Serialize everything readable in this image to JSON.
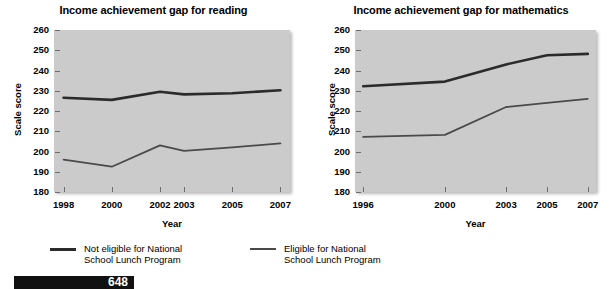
{
  "footer": {
    "page_number": "648"
  },
  "legend": {
    "items": [
      {
        "label_line1": "Not eligible for National",
        "label_line2": "School Lunch Program",
        "series": "not_eligible",
        "color": "#2b2b2b"
      },
      {
        "label_line1": "Eligible for National",
        "label_line2": "School Lunch Program",
        "series": "eligible",
        "color": "#4a4a4a"
      }
    ]
  },
  "chart_data": [
    {
      "type": "line",
      "title": "Income achievement gap for reading",
      "xlabel": "Year",
      "ylabel": "Scale score",
      "ylim": [
        180,
        260
      ],
      "yticks": [
        180,
        190,
        200,
        210,
        220,
        230,
        240,
        250,
        260
      ],
      "xticks": [
        "1998",
        "2000",
        "2002",
        "2003",
        "2005",
        "2007"
      ],
      "x": [
        1998,
        2000,
        2002,
        2003,
        2005,
        2007
      ],
      "xlim": [
        1997.6,
        2007.4
      ],
      "grid": false,
      "legend_position": "below",
      "series": [
        {
          "name": "Not eligible for National School Lunch Program",
          "color": "#2b2b2b",
          "width": 2.6,
          "values": [
            226.5,
            225.5,
            229.5,
            228.2,
            228.8,
            230.2
          ]
        },
        {
          "name": "Eligible for National School Lunch Program",
          "color": "#4a4a4a",
          "width": 1.8,
          "values": [
            196.0,
            192.5,
            203.0,
            200.3,
            202.0,
            204.0
          ]
        }
      ]
    },
    {
      "type": "line",
      "title": "Income achievement gap for mathematics",
      "xlabel": "Year",
      "ylabel": "Scale score",
      "ylim": [
        180,
        260
      ],
      "yticks": [
        180,
        190,
        200,
        210,
        220,
        230,
        240,
        250,
        260
      ],
      "xticks": [
        "1996",
        "2000",
        "2003",
        "2005",
        "2007"
      ],
      "x": [
        1996,
        2000,
        2003,
        2005,
        2007
      ],
      "xlim": [
        1995.6,
        2007.4
      ],
      "grid": false,
      "legend_position": "below",
      "series": [
        {
          "name": "Not eligible for National School Lunch Program",
          "color": "#2b2b2b",
          "width": 2.6,
          "values": [
            232.2,
            234.5,
            243.0,
            247.5,
            248.2
          ]
        },
        {
          "name": "Eligible for National School Lunch Program",
          "color": "#4a4a4a",
          "width": 1.8,
          "values": [
            207.2,
            208.2,
            222.0,
            224.0,
            226.0
          ]
        }
      ]
    }
  ]
}
